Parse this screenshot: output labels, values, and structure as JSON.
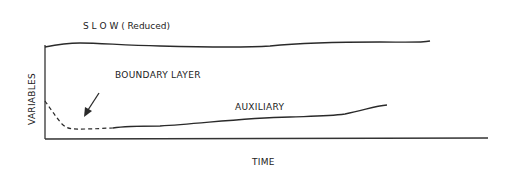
{
  "diagram": {
    "labels": {
      "slow": "S L O W ( Reduced)",
      "boundary_layer": "BOUNDARY LAYER",
      "auxiliary": "AUXILIARY",
      "x_axis": "TIME",
      "y_axis": "VARIABLES"
    },
    "colors": {
      "line": "#2a2a2a",
      "text": "#222222",
      "background": "#ffffff"
    },
    "curves": [
      {
        "name": "slow",
        "style": "solid"
      },
      {
        "name": "boundary-layer",
        "style": "dashed"
      },
      {
        "name": "auxiliary",
        "style": "solid"
      }
    ],
    "annotation": {
      "type": "arrow",
      "points_to": "boundary-layer"
    }
  }
}
